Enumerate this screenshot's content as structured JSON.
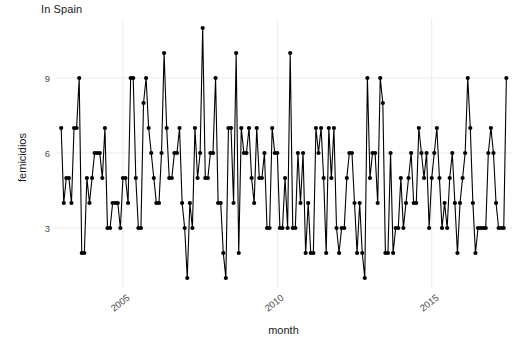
{
  "chart_data": {
    "type": "line",
    "title": "In Spain",
    "subtitle": "",
    "xlabel": "month",
    "ylabel": "femicidios",
    "x_tick_labels": [
      "2005",
      "2010",
      "2015"
    ],
    "x_tick_values": [
      2005,
      2010,
      2015
    ],
    "y_tick_labels": [
      "3",
      "6",
      "9"
    ],
    "y_tick_values": [
      3,
      6,
      9
    ],
    "xlim": [
      2002.8,
      2017.6
    ],
    "ylim": [
      0.6,
      11.4
    ],
    "grid": true,
    "legend": "none",
    "marker": "filled-circle",
    "line_color": "#000000",
    "marker_color": "#000000",
    "panel_background": "#ffffff",
    "grid_color": "#ebebeb",
    "series": [
      {
        "name": "femicidios",
        "x": [
          2003.0,
          2003.083,
          2003.167,
          2003.25,
          2003.333,
          2003.417,
          2003.5,
          2003.583,
          2003.667,
          2003.75,
          2003.833,
          2003.917,
          2004.0,
          2004.083,
          2004.167,
          2004.25,
          2004.333,
          2004.417,
          2004.5,
          2004.583,
          2004.667,
          2004.75,
          2004.833,
          2004.917,
          2005.0,
          2005.083,
          2005.167,
          2005.25,
          2005.333,
          2005.417,
          2005.5,
          2005.583,
          2005.667,
          2005.75,
          2005.833,
          2005.917,
          2006.0,
          2006.083,
          2006.167,
          2006.25,
          2006.333,
          2006.417,
          2006.5,
          2006.583,
          2006.667,
          2006.75,
          2006.833,
          2006.917,
          2007.0,
          2007.083,
          2007.167,
          2007.25,
          2007.333,
          2007.417,
          2007.5,
          2007.583,
          2007.667,
          2007.75,
          2007.833,
          2007.917,
          2008.0,
          2008.083,
          2008.167,
          2008.25,
          2008.333,
          2008.417,
          2008.5,
          2008.583,
          2008.667,
          2008.75,
          2008.833,
          2008.917,
          2009.0,
          2009.083,
          2009.167,
          2009.25,
          2009.333,
          2009.417,
          2009.5,
          2009.583,
          2009.667,
          2009.75,
          2009.833,
          2009.917,
          2010.0,
          2010.083,
          2010.167,
          2010.25,
          2010.333,
          2010.417,
          2010.5,
          2010.583,
          2010.667,
          2010.75,
          2010.833,
          2010.917,
          2011.0,
          2011.083,
          2011.167,
          2011.25,
          2011.333,
          2011.417,
          2011.5,
          2011.583,
          2011.667,
          2011.75,
          2011.833,
          2011.917,
          2012.0,
          2012.083,
          2012.167,
          2012.25,
          2012.333,
          2012.417,
          2012.5,
          2012.583,
          2012.667,
          2012.75,
          2012.833,
          2012.917,
          2013.0,
          2013.083,
          2013.167,
          2013.25,
          2013.333,
          2013.417,
          2013.5,
          2013.583,
          2013.667,
          2013.75,
          2013.833,
          2013.917,
          2014.0,
          2014.083,
          2014.167,
          2014.25,
          2014.333,
          2014.417,
          2014.5,
          2014.583,
          2014.667,
          2014.75,
          2014.833,
          2014.917,
          2015.0,
          2015.083,
          2015.167,
          2015.25,
          2015.333,
          2015.417,
          2015.5,
          2015.583,
          2015.667,
          2015.75,
          2015.833,
          2015.917,
          2016.0,
          2016.083,
          2016.167,
          2016.25,
          2016.333,
          2016.417,
          2016.5,
          2016.583,
          2016.667,
          2016.75,
          2016.833,
          2016.917,
          2017.0,
          2017.083,
          2017.167,
          2017.25,
          2017.333,
          2017.417
        ],
        "values": [
          7,
          4,
          5,
          5,
          4,
          7,
          7,
          9,
          2,
          2,
          5,
          4,
          5,
          6,
          6,
          6,
          5,
          7,
          3,
          3,
          4,
          4,
          4,
          3,
          5,
          5,
          4,
          9,
          9,
          5,
          3,
          3,
          8,
          9,
          7,
          6,
          5,
          4,
          4,
          6,
          10,
          7,
          5,
          5,
          6,
          6,
          7,
          4,
          3,
          1,
          4,
          3,
          7,
          5,
          6,
          11,
          5,
          5,
          6,
          6,
          9,
          4,
          4,
          2,
          1,
          7,
          7,
          4,
          10,
          2,
          7,
          6,
          6,
          7,
          5,
          4,
          7,
          5,
          5,
          6,
          3,
          3,
          7,
          6,
          6,
          3,
          3,
          5,
          3,
          10,
          3,
          3,
          6,
          4,
          6,
          2,
          4,
          2,
          2,
          7,
          6,
          7,
          5,
          2,
          7,
          5,
          7,
          3,
          2,
          3,
          3,
          5,
          6,
          6,
          4,
          2,
          4,
          2,
          1,
          9,
          5,
          6,
          6,
          4,
          9,
          8,
          2,
          2,
          6,
          2,
          3,
          3,
          5,
          3,
          4,
          5,
          6,
          4,
          4,
          7,
          6,
          5,
          6,
          3,
          5,
          6,
          7,
          5,
          3,
          4,
          3,
          5,
          6,
          4,
          2,
          4,
          5,
          6,
          9,
          7,
          4,
          2,
          3,
          3,
          3,
          3,
          6,
          7,
          6,
          4,
          3,
          3,
          3,
          9
        ]
      }
    ]
  },
  "axes": {
    "y_title": "femicidios",
    "x_title": "month"
  },
  "header": {
    "title": "In Spain"
  }
}
